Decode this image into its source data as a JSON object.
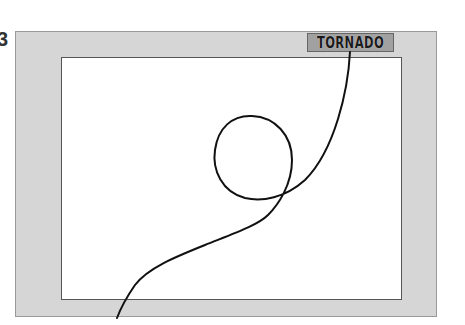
{
  "figure": {
    "number_label": "3",
    "title_label": "TORNADO"
  },
  "colors": {
    "frame": "#d6d6d6",
    "inner": "#ffffff",
    "line": "#111111"
  }
}
